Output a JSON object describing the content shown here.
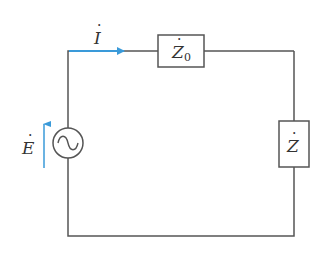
{
  "diagram": {
    "type": "circuit",
    "colors": {
      "wire": "#555555",
      "arrow": "#3a9ad9",
      "background": "#ffffff"
    },
    "components": {
      "source": {
        "symbol": "~",
        "label": "E",
        "label_dot": "·",
        "direction_arrow": "up"
      },
      "z0": {
        "label": "Z",
        "subscript": "0",
        "label_dot": "·"
      },
      "z": {
        "label": "Z",
        "label_dot": "·"
      }
    },
    "current": {
      "label": "I",
      "label_dot": "·",
      "direction": "right"
    }
  }
}
